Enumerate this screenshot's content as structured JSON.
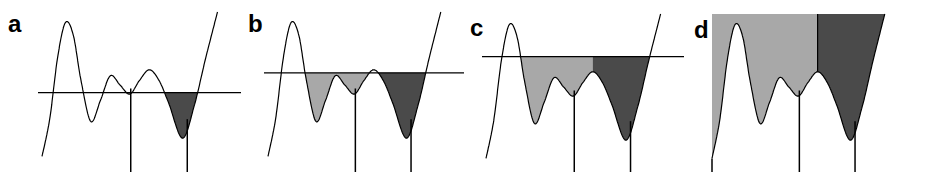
{
  "figure": {
    "colors": {
      "curve": "#000000",
      "water_line": "#000000",
      "basin_light": "#a8a8a8",
      "basin_dark": "#4a4a4a",
      "marker": "#000000"
    },
    "profile": {
      "note": "normalized 1-D profile: x in [0,1], height in [0,1] (1 = top)",
      "points": [
        [
          0.0,
          0.05
        ],
        [
          0.04,
          0.3
        ],
        [
          0.08,
          0.7
        ],
        [
          0.12,
          0.93
        ],
        [
          0.16,
          0.85
        ],
        [
          0.2,
          0.55
        ],
        [
          0.25,
          0.28
        ],
        [
          0.3,
          0.42
        ],
        [
          0.35,
          0.58
        ],
        [
          0.4,
          0.52
        ],
        [
          0.45,
          0.46
        ],
        [
          0.5,
          0.55
        ],
        [
          0.55,
          0.62
        ],
        [
          0.6,
          0.55
        ],
        [
          0.65,
          0.4
        ],
        [
          0.72,
          0.17
        ],
        [
          0.78,
          0.38
        ],
        [
          0.84,
          0.7
        ],
        [
          0.9,
          1.0
        ]
      ],
      "markers_x": [
        0.455,
        0.745
      ]
    },
    "panels": [
      {
        "label": "a",
        "water_level": 0.47,
        "light_basin": false,
        "dark_basin": true
      },
      {
        "label": "b",
        "water_level": 0.6,
        "light_basin": true,
        "dark_basin": true
      },
      {
        "label": "c",
        "water_level": 0.72,
        "light_basin": true,
        "dark_basin": true
      },
      {
        "label": "d",
        "water_level": 1.0,
        "light_basin": true,
        "dark_basin": true
      }
    ]
  }
}
